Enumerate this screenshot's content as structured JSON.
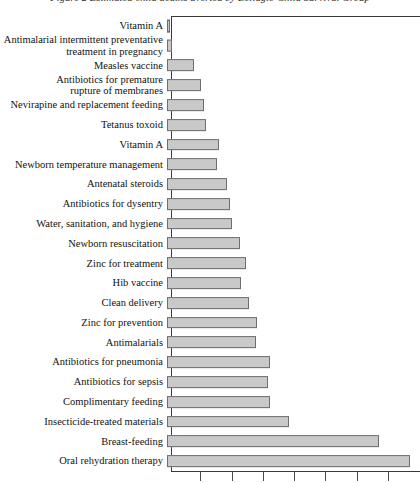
{
  "caption": "Figure 2  Estimated child deaths averted by Bellagio Child Survival Group",
  "chart_data": {
    "type": "bar",
    "orientation": "horizontal",
    "title": "Estimated child deaths averted by Bellagio Child Survival Group",
    "xlabel": "",
    "ylabel": "",
    "grid": false,
    "legend": "none",
    "axis": {
      "tick_positions_px": [
        200,
        232,
        263,
        294,
        325,
        357,
        388
      ],
      "tick_labels": [
        "",
        "",
        "",
        "",
        "",
        "",
        ""
      ],
      "xlim": [
        0,
        8
      ]
    },
    "categories": [
      "Vitamin A",
      "Antimalarial intermittent preventative treatment in pregnancy",
      "Measles vaccine",
      "Antibiotics for premature rupture of membranes",
      "Nevirapine and replacement feeding",
      "Tetanus toxoid",
      "Vitamin A",
      "Newborn temperature management",
      "Antenatal steroids",
      "Antibiotics for dysentry",
      "Water, sanitation, and hygiene",
      "Newborn resuscitation",
      "Zinc for treatment",
      "Hib vaccine",
      "Clean delivery",
      "Zinc for prevention",
      "Antimalarials",
      "Antibiotics for pneumonia",
      "Antibiotics for sepsis",
      "Complimentary feeding",
      "Insecticide-treated materials",
      "Breast-feeding",
      "Oral rehydration therapy"
    ],
    "values": [
      0.08,
      0.15,
      0.85,
      1.05,
      1.15,
      1.2,
      1.6,
      1.55,
      1.85,
      1.95,
      2.0,
      2.25,
      2.45,
      2.3,
      2.55,
      2.8,
      2.75,
      3.2,
      3.15,
      3.2,
      3.9,
      6.75,
      7.75
    ],
    "bar_pixel_lengths": [
      3,
      5,
      27,
      34,
      37,
      39,
      52,
      50,
      60,
      63,
      65,
      73,
      79,
      74,
      82,
      90,
      89,
      103,
      101,
      103,
      122,
      212,
      243
    ],
    "bar_fill_color": "#c9c9c9",
    "bar_border_color": "#6e6e6e"
  },
  "rows": [
    {
      "label": "Vitamin A",
      "label2": ""
    },
    {
      "label": "Antimalarial intermittent preventative",
      "label2": "treatment in pregnancy"
    },
    {
      "label": "Measles vaccine",
      "label2": ""
    },
    {
      "label": "Antibiotics for premature",
      "label2": "rupture of membranes"
    },
    {
      "label": "Nevirapine and replacement feeding",
      "label2": ""
    },
    {
      "label": "Tetanus toxoid",
      "label2": ""
    },
    {
      "label": "Vitamin A",
      "label2": ""
    },
    {
      "label": "Newborn temperature management",
      "label2": ""
    },
    {
      "label": "Antenatal steroids",
      "label2": ""
    },
    {
      "label": "Antibiotics for dysentry",
      "label2": ""
    },
    {
      "label": "Water, sanitation, and hygiene",
      "label2": ""
    },
    {
      "label": "Newborn resuscitation",
      "label2": ""
    },
    {
      "label": "Zinc for treatment",
      "label2": ""
    },
    {
      "label": "Hib vaccine",
      "label2": ""
    },
    {
      "label": "Clean delivery",
      "label2": ""
    },
    {
      "label": "Zinc for prevention",
      "label2": ""
    },
    {
      "label": "Antimalarials",
      "label2": ""
    },
    {
      "label": "Antibiotics for pneumonia",
      "label2": ""
    },
    {
      "label": "Antibiotics for sepsis",
      "label2": ""
    },
    {
      "label": "Complimentary feeding",
      "label2": ""
    },
    {
      "label": "Insecticide-treated materials",
      "label2": ""
    },
    {
      "label": "Breast-feeding",
      "label2": ""
    },
    {
      "label": "Oral rehydration therapy",
      "label2": ""
    }
  ]
}
